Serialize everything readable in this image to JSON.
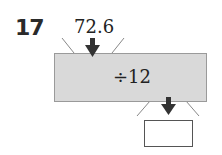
{
  "problem": {
    "number": "17",
    "input_value": "72.6",
    "operation": "÷12",
    "answer": ""
  },
  "colors": {
    "machine_fill": "#d9d9d9",
    "arrow": "#333333"
  }
}
